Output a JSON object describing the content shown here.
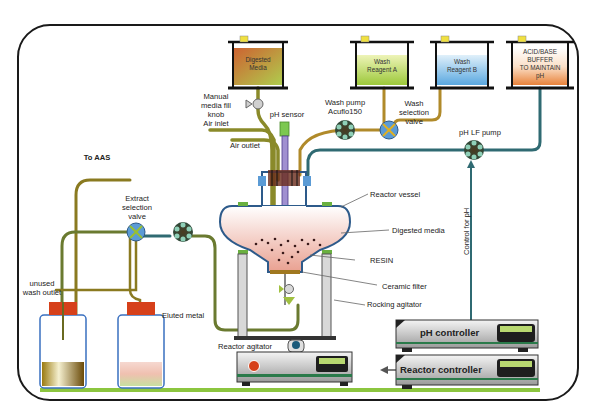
{
  "diagram": {
    "type": "process-flow-schematic",
    "colors": {
      "frame": "#1a1a1a",
      "tube_olive": "#8a8a2a",
      "tube_gold": "#b08a2a",
      "tube_teal": "#2f6a72",
      "floor": "#8cc63f",
      "vessel_outline": "#2d5a8a",
      "valve_blue": "#5b9bd5",
      "pump_dark": "#2f4a3a",
      "pump_light": "#8fd0b8",
      "cap_red": "#d6401a"
    },
    "tanks": [
      {
        "id": "digested-media",
        "label_line1": "Digested",
        "label_line2": "Media",
        "fill_top": "#c8501a",
        "fill_bottom": "#a6c83a"
      },
      {
        "id": "wash-reagent-a",
        "label_line1": "Wash",
        "label_line2": "Reagent A",
        "fill_top": "#e6f0a0",
        "fill_bottom": "#9cc83a"
      },
      {
        "id": "wash-reagent-b",
        "label_line1": "Wash",
        "label_line2": "Reagent B",
        "fill_top": "#d8ecf8",
        "fill_bottom": "#5aa8e0"
      },
      {
        "id": "acid-base-buffer",
        "label_line1": "ACID/BASE",
        "label_line2": "BUFFER",
        "label_line3": "TO MAINTAIN",
        "label_line4": "pH",
        "fill_top": "#fbe6d0",
        "fill_bottom": "#e8823a"
      }
    ],
    "labels": {
      "manual_fill_1": "Manual",
      "manual_fill_2": "media fill",
      "manual_fill_3": "knob",
      "air_inlet": "Air inlet",
      "air_outlet": "Air outlet",
      "ph_sensor": "pH sensor",
      "wash_pump_1": "Wash pump",
      "wash_pump_2": "Acuflo150",
      "wash_valve_1": "Wash",
      "wash_valve_2": "selection",
      "wash_valve_3": "valve",
      "ph_lf_pump": "pH LF pump",
      "control_for_ph": "Control for pH",
      "to_aas": "To AAS",
      "extract_valve_1": "Extract",
      "extract_valve_2": "selection",
      "extract_valve_3": "valve",
      "reactor_vessel": "Reactor vessel",
      "digested_media": "Digested media",
      "resin": "RESIN",
      "ceramic_filter": "Ceramic filter",
      "rocking_agitator": "Rocking agitator",
      "unused_wash_1": "unused",
      "unused_wash_2": "wash outlet",
      "eluted_metal": "Eluted metal",
      "reactor_agitator": "Reactor agitator",
      "ph_controller": "pH controller",
      "reactor_controller": "Reactor controller"
    }
  }
}
